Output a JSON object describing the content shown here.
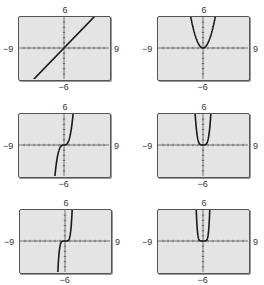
{
  "window": {
    "xmin": -9,
    "xmax": 9,
    "ymin": -6,
    "ymax": 6,
    "xscl": 1,
    "yscl": 1
  },
  "labels": {
    "ymax": "6",
    "ymin": "−6",
    "xmin": "−9",
    "xmax": "9"
  },
  "colors": {
    "screen": "#e4e4e4",
    "frame": "#555555",
    "curve": "#1a1a1a",
    "axis": "#555555"
  },
  "chart_data": [
    {
      "type": "line",
      "title": "",
      "function": "y = x",
      "exponent": 1,
      "xlim": [
        -9,
        9
      ],
      "ylim": [
        -6,
        6
      ],
      "xtick_labels": [
        "−9",
        "9"
      ],
      "ytick_labels": [
        "−6",
        "6"
      ],
      "grid": false
    },
    {
      "type": "line",
      "title": "",
      "function": "y = x^2",
      "exponent": 2,
      "xlim": [
        -9,
        9
      ],
      "ylim": [
        -6,
        6
      ],
      "xtick_labels": [
        "−9",
        "9"
      ],
      "ytick_labels": [
        "−6",
        "6"
      ],
      "grid": false
    },
    {
      "type": "line",
      "title": "",
      "function": "y = x^3",
      "exponent": 3,
      "xlim": [
        -9,
        9
      ],
      "ylim": [
        -6,
        6
      ],
      "xtick_labels": [
        "−9",
        "9"
      ],
      "ytick_labels": [
        "−6",
        "6"
      ],
      "grid": false
    },
    {
      "type": "line",
      "title": "",
      "function": "y = x^4",
      "exponent": 4,
      "xlim": [
        -9,
        9
      ],
      "ylim": [
        -6,
        6
      ],
      "xtick_labels": [
        "−9",
        "9"
      ],
      "ytick_labels": [
        "−6",
        "6"
      ],
      "grid": false
    },
    {
      "type": "line",
      "title": "",
      "function": "y = x^5",
      "exponent": 5,
      "xlim": [
        -9,
        9
      ],
      "ylim": [
        -6,
        6
      ],
      "xtick_labels": [
        "−9",
        "9"
      ],
      "ytick_labels": [
        "−6",
        "6"
      ],
      "grid": false
    },
    {
      "type": "line",
      "title": "",
      "function": "y = x^6",
      "exponent": 6,
      "xlim": [
        -9,
        9
      ],
      "ylim": [
        -6,
        6
      ],
      "xtick_labels": [
        "−9",
        "9"
      ],
      "ytick_labels": [
        "−6",
        "6"
      ],
      "grid": false
    }
  ],
  "panels": [
    {
      "left": 18,
      "top": 16,
      "width": 93,
      "height": 65
    },
    {
      "left": 157,
      "top": 16,
      "width": 93,
      "height": 65
    },
    {
      "left": 18,
      "top": 113,
      "width": 93,
      "height": 65
    },
    {
      "left": 157,
      "top": 113,
      "width": 93,
      "height": 65
    },
    {
      "left": 19,
      "top": 209,
      "width": 93,
      "height": 65
    },
    {
      "left": 157,
      "top": 209,
      "width": 93,
      "height": 65
    }
  ]
}
